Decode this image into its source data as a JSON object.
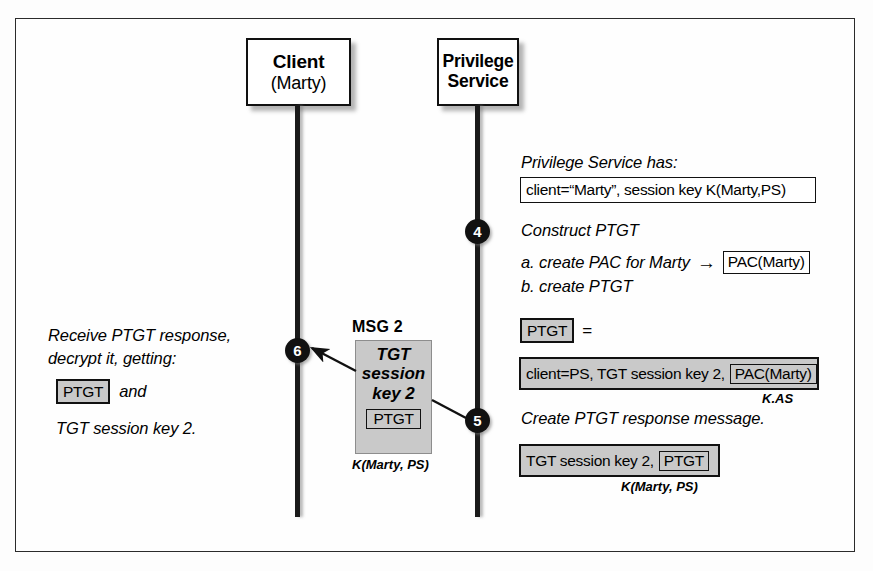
{
  "diagram": {
    "actors": [
      {
        "id": "client",
        "line1": "Client",
        "line2": "(Marty)"
      },
      {
        "id": "privilege-service",
        "line1": "Privilege",
        "line2": "Service"
      }
    ],
    "steps": [
      {
        "number": "4"
      },
      {
        "number": "5"
      },
      {
        "number": "6"
      }
    ],
    "right_column": {
      "heading": "Privilege Service has:",
      "state_box": "client=“Marty”, session key K(Marty,PS)",
      "step4_title": "Construct PTGT",
      "step4_a": "a. create PAC for Marty",
      "step4_a_arrow": "→",
      "step4_a_token": "PAC(Marty)",
      "step4_b": "b. create PTGT",
      "ptgt_token": "PTGT",
      "ptgt_equals": "=",
      "ptgt_contents_text": "client=PS, TGT session key 2,",
      "ptgt_contents_token": "PAC(Marty)",
      "ptgt_contents_key": "K.AS",
      "step5_title": "Create PTGT response message.",
      "response_text": "TGT session key 2,",
      "response_token": "PTGT",
      "response_key": "K(Marty, PS)"
    },
    "left_column": {
      "line1": "Receive PTGT response,",
      "line2": "decrypt it, getting:",
      "token": "PTGT",
      "and_word": "and",
      "line3": "TGT session key 2."
    },
    "message": {
      "label": "MSG 2",
      "body_lines": [
        "TGT",
        "session",
        "key 2"
      ],
      "inner_token": "PTGT",
      "key": "K(Marty, PS)"
    },
    "colors": {
      "ink": "#111111",
      "shade": "#c9c9c9",
      "paper": "#fefefe",
      "frame": "#2b2b2b"
    }
  }
}
